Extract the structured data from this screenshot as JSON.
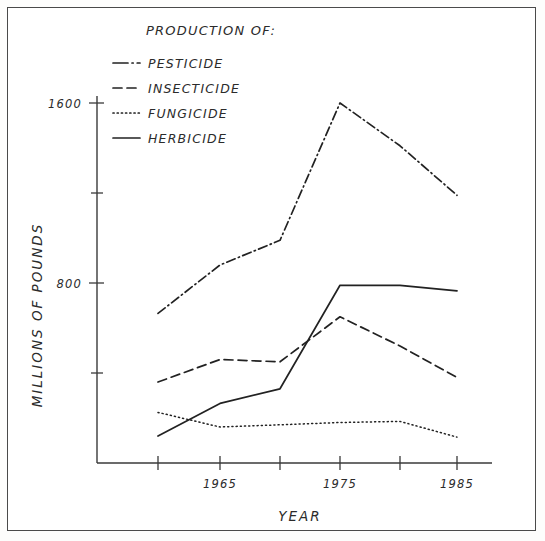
{
  "figure": {
    "title": "PRODUCTION OF:",
    "background_color": "#ffffff",
    "ink_color": "#222222"
  },
  "legend": {
    "title": "PRODUCTION OF:",
    "position": "upper-left-inside",
    "entries": [
      {
        "label": "PESTICIDE",
        "dash": "dash-dot"
      },
      {
        "label": "INSECTICIDE",
        "dash": "dashed"
      },
      {
        "label": "FUNGICIDE",
        "dash": "dotted"
      },
      {
        "label": "HERBICIDE",
        "dash": "solid"
      }
    ]
  },
  "axes": {
    "x_title": "YEAR",
    "y_title": "MILLIONS OF POUNDS",
    "x_tick_labels": [
      "",
      "1965",
      "",
      "1975",
      "",
      "1985"
    ],
    "x_tick_values": [
      1960,
      1965,
      1970,
      1975,
      1980,
      1985
    ],
    "y_tick_labels": [
      "",
      "1600",
      "",
      "800",
      ""
    ],
    "y_tick_values": [
      2000,
      1600,
      1200,
      800,
      400
    ],
    "x_range": [
      1958,
      1988
    ],
    "y_range": [
      0,
      2060
    ],
    "grid": "off"
  },
  "chart_data": {
    "type": "line",
    "title": "PRODUCTION OF:",
    "xlabel": "YEAR",
    "ylabel": "MILLIONS OF POUNDS",
    "xlim": [
      1958,
      1988
    ],
    "ylim": [
      0,
      2060
    ],
    "grid": false,
    "legend_position": "upper left",
    "x": [
      1960,
      1965,
      1970,
      1975,
      1980,
      1985
    ],
    "xtick_labels": [
      "",
      "1965",
      "",
      "1975",
      "",
      "1985"
    ],
    "ytick_values": [
      800,
      1600
    ],
    "series": [
      {
        "name": "PESTICIDE",
        "style": "dash-dot",
        "values": [
          665,
          880,
          990,
          1600,
          1410,
          1190
        ]
      },
      {
        "name": "INSECTICIDE",
        "style": "dashed",
        "values": [
          360,
          460,
          450,
          650,
          520,
          380
        ]
      },
      {
        "name": "FUNGICIDE",
        "style": "dotted",
        "values": [
          225,
          160,
          170,
          180,
          185,
          115
        ]
      },
      {
        "name": "HERBICIDE",
        "style": "solid",
        "values": [
          120,
          265,
          330,
          790,
          790,
          765
        ]
      }
    ]
  },
  "geometry": {
    "plot_left_px": 97,
    "plot_bottom_px": 463,
    "x_px": [
      158,
      220,
      280,
      340,
      400,
      457
    ],
    "y_px_1600": 103,
    "y_px_800": 283
  }
}
